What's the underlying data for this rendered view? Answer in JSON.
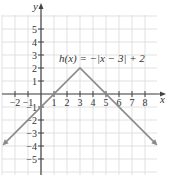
{
  "chart_data": {
    "type": "line",
    "title": "",
    "function_label": "h(x) = −|x − 3| + 2",
    "xlabel": "x",
    "ylabel": "y",
    "xlim": [
      -3,
      9
    ],
    "ylim": [
      -6,
      6
    ],
    "x_ticks": [
      -2,
      -1,
      1,
      2,
      3,
      4,
      5,
      6,
      7,
      8
    ],
    "x_tick_labels": [
      "−2",
      "−1",
      "1",
      "2",
      "3",
      "4",
      "5",
      "6",
      "7",
      "8"
    ],
    "y_ticks": [
      5,
      4,
      3,
      2,
      1,
      -1,
      -2,
      -3,
      -4,
      -5
    ],
    "y_tick_labels": [
      "5",
      "4",
      "3",
      "2",
      "1",
      "−1",
      "−2",
      "−3",
      "−4",
      "−5"
    ],
    "grid": true,
    "series": [
      {
        "name": "h(x) = −|x − 3| + 2",
        "x": [
          -3,
          3,
          9
        ],
        "y": [
          -4,
          2,
          -4
        ],
        "vertex": [
          3,
          2
        ],
        "arrows": "both ends"
      }
    ]
  },
  "colors": {
    "grid": "#d9d9d9",
    "axis": "#444444",
    "curve": "#8a8a8a"
  }
}
